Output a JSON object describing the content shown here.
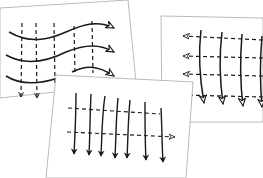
{
  "diagram": {
    "colors": {
      "ink": "#1a1a1a",
      "paper": "#ffffff",
      "edge": "#9a9a9a"
    },
    "cards": [
      {
        "id": "left-card",
        "content": "Three wavy solid curves flowing left to right with open arrowheads, crossed by five vertical dashed lines; two dashed lines end in down arrows"
      },
      {
        "id": "right-card",
        "content": "Five vertical solid lines with open down arrowheads, crossed by four horizontal dashed lines ending in left-pointing open arrowheads"
      },
      {
        "id": "front-card",
        "content": "Seven vertical solid lines with filled down arrowheads, crossed by two horizontal dashed lines; lower dashed line ends in right-pointing open arrowhead"
      }
    ]
  }
}
